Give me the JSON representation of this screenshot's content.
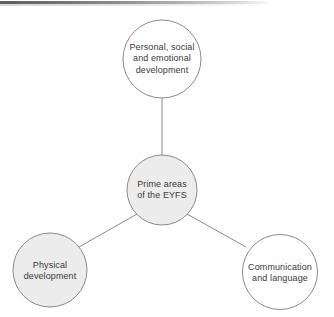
{
  "diagram": {
    "type": "hub-and-spoke",
    "title": "Prime areas of the EYFS",
    "background_color": "#ffffff",
    "stroke_color": "#8a8a8a",
    "text_color": "#3a3a3a",
    "shaded_fill": "#ececec",
    "plain_fill": "#ffffff",
    "nodes": [
      {
        "id": "personal-social-emotional",
        "role": "spoke",
        "lines": [
          "Personal, social",
          "and emotional",
          "development"
        ],
        "fill": "#ffffff",
        "cx": 162,
        "cy": 59,
        "r": 39
      },
      {
        "id": "prime-areas-eyfs",
        "role": "hub",
        "lines": [
          "Prime areas",
          "of the EYFS"
        ],
        "fill": "#ececec",
        "cx": 162,
        "cy": 190,
        "r": 35
      },
      {
        "id": "physical-development",
        "role": "spoke",
        "lines": [
          "Physical",
          "development"
        ],
        "fill": "#ececec",
        "cx": 50,
        "cy": 270,
        "r": 37
      },
      {
        "id": "communication-and-language",
        "role": "spoke",
        "lines": [
          "Communication",
          "and language"
        ],
        "fill": "#ffffff",
        "cx": 280,
        "cy": 272,
        "r": 37.5
      }
    ],
    "connectors": [
      {
        "id": "hub-to-personal-social-emotional",
        "x1": 162,
        "y1": 155,
        "x2": 162,
        "y2": 98
      },
      {
        "id": "hub-to-physical-development",
        "x1": 137,
        "y1": 214,
        "x2": 79,
        "y2": 247
      },
      {
        "id": "hub-to-communication-and-language",
        "x1": 187,
        "y1": 214,
        "x2": 246,
        "y2": 247
      }
    ],
    "artifact": {
      "id": "scan-edge-bar",
      "description": "dark scan bar along top-left edge"
    }
  }
}
